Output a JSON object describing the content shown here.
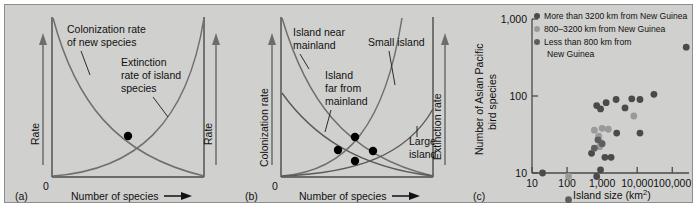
{
  "figure": {
    "background_color": "#d0d0ce",
    "panels": [
      "a",
      "b",
      "c"
    ]
  },
  "panel_a": {
    "tag": "(a)",
    "y_axis_left_label": "Rate",
    "y_axis_right_label": "Rate",
    "x_axis_label": "Number of species",
    "origin_label": "0",
    "annotations": [
      {
        "id": "colonization",
        "text": "Colonization rate\nof new species",
        "line1": "Colonization rate",
        "line2": "of new species"
      },
      {
        "id": "extinction",
        "text": "Extinction rate of island species",
        "line1": "Extinction",
        "line2": "rate of island",
        "line3": "species"
      }
    ],
    "equilibrium_points": 1
  },
  "panel_b": {
    "tag": "(b)",
    "y_axis_left_label": "Colonization rate",
    "y_axis_right_label": "Extinction rate",
    "x_axis_label": "Number of species",
    "origin_label": "0",
    "annotations": [
      {
        "id": "island-near-mainland",
        "line1": "Island near",
        "line2": "mainland"
      },
      {
        "id": "island-far-from-mainland",
        "line1": "Island",
        "line2": "far from",
        "line3": "mainland"
      },
      {
        "id": "small-island",
        "line1": "Small island"
      },
      {
        "id": "large-island",
        "line1": "Large",
        "line2": "island"
      }
    ],
    "equilibrium_points": 4
  },
  "panel_c": {
    "tag": "(c)",
    "chart_data": {
      "type": "scatter",
      "title": "",
      "xlabel": "Island size (km2)",
      "xlabel_main": "Island size (km",
      "xlabel_sup": "2",
      "xlabel_tail": ")",
      "ylabel": "Number of Asian Pacific bird species",
      "ylabel_line1": "Number of Asian Pacific",
      "ylabel_line2": "bird species",
      "x_scale": "log",
      "y_scale": "log",
      "xlim": [
        10,
        300000
      ],
      "ylim": [
        10,
        1000
      ],
      "xticks": [
        10,
        100,
        1000,
        10000,
        100000
      ],
      "xtick_labels": [
        "10",
        "100",
        "1,000",
        "10,000",
        "100,000"
      ],
      "yticks": [
        10,
        100,
        1000
      ],
      "ytick_labels": [
        "10",
        "100",
        "1,000"
      ],
      "grid": false,
      "legend_position": "top-left",
      "legend": [
        {
          "label": "More than 3200 km from New Guinea",
          "color": "#4a4a4a",
          "series": "far"
        },
        {
          "label": "800–3200 km from New Guinea",
          "color": "#9a9a9a",
          "series": "mid"
        },
        {
          "label": "Less than 800 km from New Guinea",
          "label_line1": "Less than 800 km from",
          "label_line2": "New Guinea",
          "color": "#5e5e5e",
          "series": "near"
        }
      ],
      "series": [
        {
          "name": "More than 3200 km from New Guinea",
          "color": "#4a4a4a",
          "points": [
            [
              700,
              75
            ],
            [
              900,
              68
            ],
            [
              1300,
              82
            ],
            [
              2500,
              90
            ],
            [
              4500,
              70
            ],
            [
              7000,
              92
            ],
            [
              12000,
              90
            ],
            [
              30000,
              105
            ],
            [
              250000,
              430
            ],
            [
              1200,
              16
            ],
            [
              700,
              9
            ],
            [
              900,
              11
            ],
            [
              500,
              18
            ],
            [
              450,
              2.2
            ],
            [
              20,
              10
            ],
            [
              1800,
              16
            ],
            [
              12000,
              33
            ],
            [
              2600,
              33
            ]
          ]
        },
        {
          "name": "800–3200 km from New Guinea",
          "color": "#9a9a9a",
          "points": [
            [
              600,
              36
            ],
            [
              800,
              30
            ],
            [
              1000,
              38
            ],
            [
              900,
              25
            ],
            [
              110,
              9
            ],
            [
              8000,
              55
            ],
            [
              1500,
              37
            ],
            [
              850,
              22
            ]
          ]
        },
        {
          "name": "Less than 800 km from New Guinea",
          "color": "#5e5e5e",
          "points": [
            [
              760,
              27
            ],
            [
              1000,
              24
            ],
            [
              600,
              21
            ],
            [
              110,
              4.5
            ]
          ]
        }
      ]
    }
  }
}
